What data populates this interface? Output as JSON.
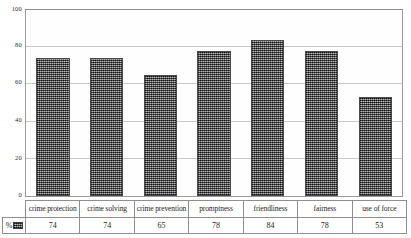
{
  "chart_data": {
    "type": "bar",
    "title": "",
    "xlabel": "",
    "ylabel": "",
    "ylim": [
      0,
      100
    ],
    "yticks": [
      "0",
      "20",
      "40",
      "60",
      "80",
      "100"
    ],
    "grid": true,
    "legend": {
      "position": "table-corner",
      "label": "%",
      "swatch_color": "#6f6f6f"
    },
    "categories": [
      "crime protection",
      "crime solving",
      "crime prevention",
      "promptness",
      "friendliness",
      "fairness",
      "use of force"
    ],
    "values": [
      74,
      74,
      65,
      78,
      84,
      78,
      53
    ],
    "value_labels": [
      "74",
      "74",
      "65",
      "78",
      "84",
      "78",
      "53"
    ],
    "series": [
      {
        "name": "%",
        "values": [
          74,
          74,
          65,
          78,
          84,
          78,
          53
        ]
      }
    ]
  },
  "colors": {
    "bar_fill": "#6f6f6f",
    "bar_border": "#4a4a4a",
    "gridline": "#c9c9c9",
    "frame": "#9a9a9a",
    "text": "#242424",
    "background": "#ffffff"
  }
}
